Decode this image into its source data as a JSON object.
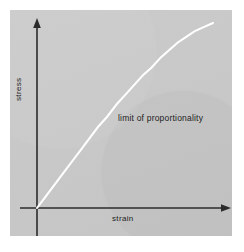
{
  "figure": {
    "background_color": "#ffffff",
    "panel_color": "#c9c9c9",
    "axis_color": "#2b2b2b",
    "curve_color": "#ffffff",
    "text_color": "#1c1c1c"
  },
  "labels": {
    "ylabel": "stress",
    "xlabel": "strain",
    "annotation": "limit of proportionality"
  },
  "chart_data": {
    "type": "line",
    "title": "",
    "subtitle": "",
    "xlabel": "strain",
    "ylabel": "stress",
    "xlim": [
      0,
      1
    ],
    "ylim": [
      0,
      1
    ],
    "grid": false,
    "legend": null,
    "axes_style": {
      "spines": [
        "left",
        "bottom"
      ],
      "arrowheads": [
        "x-axis-right",
        "y-axis-top"
      ],
      "ticks": "none",
      "tick_labels": "none"
    },
    "annotations": [
      {
        "text": "limit of proportionality",
        "x": 0.42,
        "y": 0.52,
        "note": "labels the region where the curve departs from the initial straight line"
      }
    ],
    "series": [
      {
        "name": "stress-strain curve",
        "color": "#ffffff",
        "linewidth": 2,
        "x": [
          0.0,
          0.05,
          0.1,
          0.15,
          0.2,
          0.25,
          0.3,
          0.35,
          0.4,
          0.45,
          0.5,
          0.55,
          0.6,
          0.65,
          0.7,
          0.75,
          0.8,
          0.85,
          0.9,
          0.95,
          1.0
        ],
        "y": [
          0.0,
          0.06,
          0.12,
          0.18,
          0.24,
          0.3,
          0.36,
          0.42,
          0.47,
          0.53,
          0.58,
          0.63,
          0.68,
          0.72,
          0.77,
          0.81,
          0.85,
          0.88,
          0.91,
          0.93,
          0.95
        ],
        "description": "initially linear (proportional) rising from the origin, then curving over and flattening toward the top right"
      }
    ]
  }
}
